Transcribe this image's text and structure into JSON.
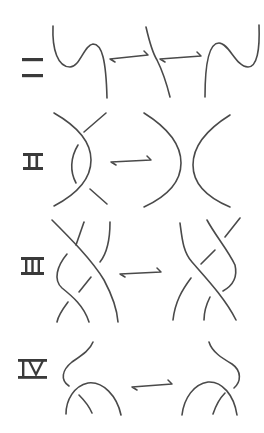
{
  "moves": [
    {
      "label": "I",
      "description": "Twist / untwist a loop",
      "arrow": "left-right harpoon"
    },
    {
      "label": "II",
      "description": "Slide one strand over another",
      "arrow": "left-right harpoon"
    },
    {
      "label": "III",
      "description": "Slide a strand over a crossing",
      "arrow": "left-right harpoon"
    },
    {
      "label": "IV",
      "description": "Move a strand past a crossing",
      "arrow": "left-right harpoon"
    }
  ],
  "colors": {
    "stroke": "#4a4a4a",
    "label": "#3a3a3a",
    "background": "#ffffff"
  }
}
